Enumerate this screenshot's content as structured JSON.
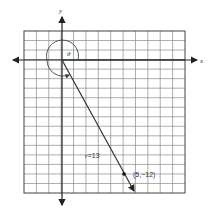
{
  "diagram": {
    "type": "polar-angle-coordinate-plane",
    "axes": {
      "x_label": "x",
      "y_label": "y"
    },
    "grid": {
      "columns": 13,
      "rows": 17,
      "line_color": "#8a8a8a",
      "axis_color": "#222222"
    },
    "angle_label": "θ",
    "radius_label": "r=13",
    "point": {
      "x": 5,
      "y": -12,
      "label": "(5,−12)"
    }
  }
}
